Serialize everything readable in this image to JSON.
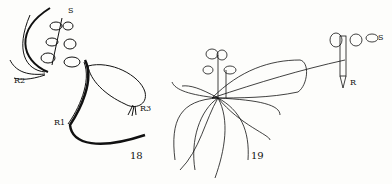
{
  "figures": [
    {
      "number": "18",
      "labels": {
        "shoot": "S",
        "root_left": "R2",
        "root_main": "R1",
        "root_right": "R3"
      }
    },
    {
      "number": "19",
      "labels": {
        "shoot": "S",
        "root": "R"
      }
    }
  ],
  "colors": {
    "ink": "#111111",
    "paper": "#fdfdfb"
  }
}
